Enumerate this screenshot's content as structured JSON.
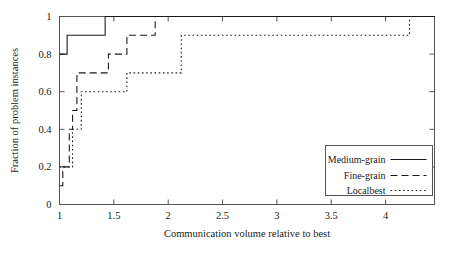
{
  "chart_data": {
    "type": "line",
    "title": "",
    "subtitle": "",
    "xlabel": "Communication volume relative to best",
    "ylabel": "Fraction of problem instances",
    "xlim": [
      1,
      4.45
    ],
    "ylim": [
      0,
      1
    ],
    "xticks": [
      1,
      1.5,
      2,
      2.5,
      3,
      3.5,
      4
    ],
    "xtick_labels": [
      "1",
      "1.5",
      "2",
      "2.5",
      "3",
      "3.5",
      "4"
    ],
    "yticks": [
      0,
      0.2,
      0.4,
      0.6,
      0.8,
      1
    ],
    "ytick_labels": [
      "0",
      "0.2",
      "0.4",
      "0.6",
      "0.8",
      "1"
    ],
    "grid": false,
    "legend_position": "lower right",
    "step_type": "post",
    "series": [
      {
        "name": "Medium-grain",
        "style": "solid",
        "color": "#1a1a1a",
        "x": [
          1.0,
          1.07,
          1.42,
          4.45
        ],
        "y": [
          0.8,
          0.9,
          1.0,
          1.0
        ]
      },
      {
        "name": "Fine-grain",
        "style": "dashed",
        "color": "#1a1a1a",
        "x": [
          1.0,
          1.03,
          1.09,
          1.12,
          1.16,
          1.27,
          1.45,
          1.62,
          1.88,
          4.45
        ],
        "y": [
          0.1,
          0.2,
          0.4,
          0.5,
          0.7,
          0.7,
          0.8,
          0.9,
          1.0,
          1.0
        ]
      },
      {
        "name": "Localbest",
        "style": "dotted",
        "color": "#1a1a1a",
        "x": [
          1.0,
          1.12,
          1.2,
          1.33,
          1.62,
          2.12,
          4.22,
          4.45
        ],
        "y": [
          0.2,
          0.4,
          0.6,
          0.6,
          0.7,
          0.9,
          1.0,
          1.0
        ]
      }
    ]
  },
  "legend": {
    "entries": [
      {
        "label": "Medium-grain",
        "style": "solid"
      },
      {
        "label": "Fine-grain",
        "style": "dashed"
      },
      {
        "label": "Localbest",
        "style": "dotted"
      }
    ]
  }
}
